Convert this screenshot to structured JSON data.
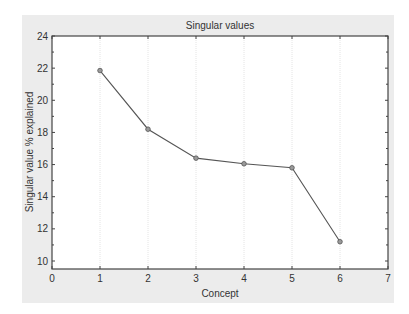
{
  "chart_data": {
    "type": "line",
    "title": "Singular values",
    "xlabel": "Concept",
    "ylabel": "Singular value % explained",
    "x": [
      1,
      2,
      3,
      4,
      5,
      6
    ],
    "series": [
      {
        "name": "Singular value % explained",
        "values": [
          21.85,
          18.2,
          16.4,
          16.05,
          15.8,
          11.2
        ]
      }
    ],
    "xlim": [
      0,
      7
    ],
    "ylim": [
      9.5,
      24
    ],
    "xticks": [
      0,
      1,
      2,
      3,
      4,
      5,
      6,
      7
    ],
    "yticks": [
      10,
      12,
      14,
      16,
      18,
      20,
      22,
      24
    ],
    "grid": "vertical dotted at x ticks",
    "legend": "none"
  },
  "colors": {
    "panel_bg": "#ececec",
    "plot_bg": "#ffffff",
    "line": "#555555",
    "marker": "#777777",
    "axis": "#444444"
  }
}
